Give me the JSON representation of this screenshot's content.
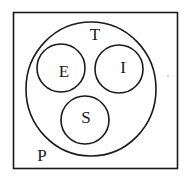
{
  "diagram": {
    "type": "venn-euler",
    "colors": {
      "stroke": "#1a1a1a",
      "background": "#ffffff"
    },
    "universe": {
      "label": "P",
      "shape": "rectangle"
    },
    "outer_set": {
      "label": "T",
      "shape": "circle"
    },
    "inner_sets": [
      {
        "label": "E",
        "shape": "circle"
      },
      {
        "label": "I",
        "shape": "circle"
      },
      {
        "label": "S",
        "shape": "circle"
      }
    ],
    "relations": [
      "E ⊂ T",
      "I ⊂ T",
      "S ⊂ T",
      "T ⊂ P",
      "E, I, S are mutually disjoint"
    ]
  }
}
